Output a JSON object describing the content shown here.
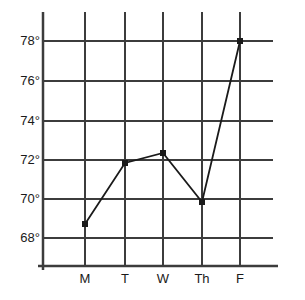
{
  "chart_data": {
    "type": "line",
    "title": "",
    "xlabel": "",
    "ylabel": "",
    "categories": [
      "M",
      "T",
      "W",
      "Th",
      "F"
    ],
    "values": [
      68.7,
      71.8,
      72.3,
      69.8,
      77.7
    ],
    "series": [
      {
        "name": "Temperature",
        "values": [
          68.7,
          71.8,
          72.3,
          69.8,
          77.7
        ]
      }
    ],
    "ylim": [
      67.0,
      79.0
    ],
    "y_ticks": [
      68,
      70,
      72,
      74,
      76,
      78
    ],
    "y_tick_labels": [
      "68°",
      "70°",
      "72°",
      "74°",
      "76°",
      "78°"
    ],
    "x_tick_labels": [
      "M",
      "T",
      "W",
      "Th",
      "F"
    ],
    "grid": true,
    "legend": "none",
    "marker": "square",
    "line_color": "#1a1a1a",
    "marker_color": "#1a1a1a",
    "grid_color": "#3c3c3c",
    "axis_color": "#3c3c3c",
    "background_color": "#ffffff"
  },
  "axes": {
    "y_ticks": [
      {
        "label": "78°",
        "value": 78,
        "y": 41
      },
      {
        "label": "76°",
        "value": 76,
        "y": 81
      },
      {
        "label": "74°",
        "value": 74,
        "y": 121
      },
      {
        "label": "72°",
        "value": 72,
        "y": 160
      },
      {
        "label": "70°",
        "value": 70,
        "y": 199
      },
      {
        "label": "68°",
        "value": 68,
        "y": 238
      }
    ],
    "x_ticks": [
      {
        "label": "M",
        "x": 85
      },
      {
        "label": "T",
        "x": 125
      },
      {
        "label": "W",
        "x": 163
      },
      {
        "label": "Th",
        "x": 202
      },
      {
        "label": "F",
        "x": 240
      }
    ]
  },
  "points": [
    {
      "label": "M",
      "value": 68.7,
      "x": 85,
      "y": 224
    },
    {
      "label": "T",
      "value": 71.8,
      "x": 125,
      "y": 163
    },
    {
      "label": "W",
      "value": 72.3,
      "x": 163,
      "y": 153
    },
    {
      "label": "Th",
      "value": 69.8,
      "x": 202,
      "y": 202
    },
    {
      "label": "F",
      "value": 77.7,
      "x": 240,
      "y": 41
    }
  ]
}
